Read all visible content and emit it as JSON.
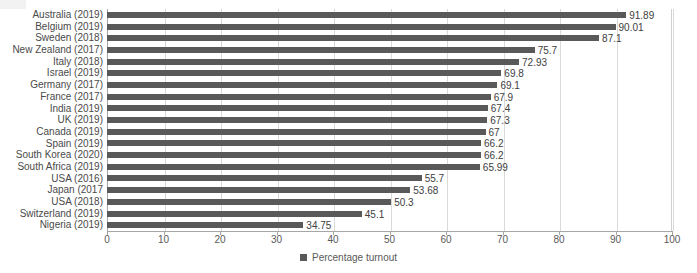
{
  "chart_data": {
    "type": "bar",
    "orientation": "horizontal",
    "title": "",
    "xlabel": "",
    "ylabel": "",
    "xlim": [
      0,
      100
    ],
    "xticks": [
      0,
      10,
      20,
      30,
      40,
      50,
      60,
      70,
      80,
      90,
      100
    ],
    "grid": true,
    "legend_position": "bottom",
    "series": [
      {
        "name": "Percentage turnout",
        "color": "#595959",
        "values": [
          91.89,
          90.01,
          87.1,
          75.7,
          72.93,
          69.8,
          69.1,
          67.9,
          67.4,
          67.3,
          67,
          66.2,
          66.2,
          65.99,
          55.7,
          53.68,
          50.3,
          45.1,
          34.75
        ]
      }
    ],
    "categories": [
      "Australia (2019)",
      "Belgium (2019)",
      "Sweden (2018)",
      "New Zealand (2017)",
      "Italy (2018)",
      "Israel (2019)",
      "Germany (2017)",
      "France (2017)",
      "India (2019)",
      "UK (2019)",
      "Canada (2019)",
      "Spain (2019)",
      "South Korea (2020)",
      "South Africa (2019)",
      "USA (2016)",
      "Japan (2017",
      "USA (2018)",
      "Switzerland (2019)",
      "Nigeria (2019)"
    ],
    "value_labels": [
      "91.89",
      "90.01",
      "87.1",
      "75.7",
      "72.93",
      "69.8",
      "69.1",
      "67.9",
      "67.4",
      "67.3",
      "67",
      "66.2",
      "66.2",
      "65.99",
      "55.7",
      "53.68",
      "50.3",
      "45.1",
      "34.75"
    ]
  },
  "legend": {
    "label": "Percentage turnout"
  }
}
